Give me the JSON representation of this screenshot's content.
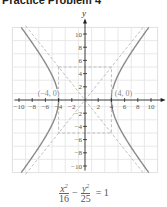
{
  "header": {
    "title": "Practice Problem 4"
  },
  "chart_data": {
    "type": "line",
    "title": "",
    "xlabel": "x",
    "ylabel": "y",
    "xlim": [
      -11,
      11
    ],
    "ylim": [
      -11,
      11
    ],
    "grid": true,
    "x_ticks": [
      -10,
      -8,
      -6,
      -4,
      -2,
      2,
      4,
      6,
      8,
      10
    ],
    "y_ticks": [
      -10,
      -8,
      -6,
      -4,
      -2,
      2,
      4,
      6,
      8,
      10
    ],
    "x_tick_labels": [
      "−10",
      "−8",
      "−6",
      "−4",
      "−2",
      "2",
      "4",
      "6",
      "8",
      "10"
    ],
    "y_tick_labels": [
      "10",
      "8",
      "6",
      "4",
      "2",
      "−2",
      "−4",
      "−6",
      "−8",
      "−10"
    ],
    "series": [
      {
        "name": "hyperbola x^2/16 - y^2/25 = 1",
        "style": "solid",
        "color": "#8a8a8a",
        "vertices": [
          [
            -4,
            0
          ],
          [
            4,
            0
          ]
        ]
      },
      {
        "name": "asymptote y = 5/4 x",
        "style": "dashed",
        "color": "#b0b0b0"
      },
      {
        "name": "asymptote y = -5/4 x",
        "style": "dashed",
        "color": "#b0b0b0"
      },
      {
        "name": "central rectangle",
        "style": "dashed",
        "color": "#b0b0b0",
        "corners": [
          [
            -4,
            5
          ],
          [
            4,
            5
          ],
          [
            4,
            -5
          ],
          [
            -4,
            -5
          ]
        ]
      }
    ],
    "annotations": [
      {
        "text": "(−4, 0)",
        "x": -4,
        "y": 0
      },
      {
        "text": "(4, 0)",
        "x": 4,
        "y": 0
      }
    ],
    "equation": {
      "num1": "x",
      "exp1": "2",
      "den1": "16",
      "op": "−",
      "num2": "y",
      "exp2": "2",
      "den2": "25",
      "rhs": "= 1"
    }
  }
}
